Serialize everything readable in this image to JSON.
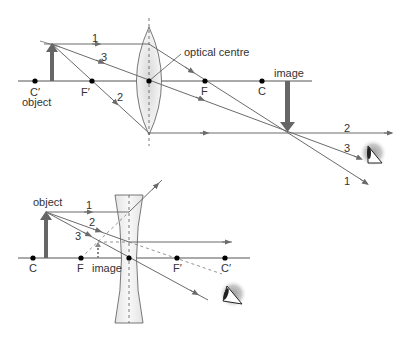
{
  "diagrams": [
    {
      "name": "converging-lens",
      "labels": {
        "optical_centre": "optical centre",
        "image": "image",
        "object": "object",
        "c_prime": "C′",
        "f_prime": "F′",
        "f": "F",
        "c": "C"
      },
      "rays": [
        "1",
        "2",
        "3"
      ]
    },
    {
      "name": "diverging-lens",
      "labels": {
        "object": "object",
        "image": "image",
        "c": "C",
        "f": "F",
        "f_prime": "F′",
        "c_prime": "C′"
      },
      "rays": [
        "1",
        "2",
        "3"
      ]
    }
  ],
  "colors": {
    "ray": "#6b6b6b",
    "arrow": "#666666",
    "lens_fill": "#e6e6e6",
    "axis": "#555555"
  }
}
